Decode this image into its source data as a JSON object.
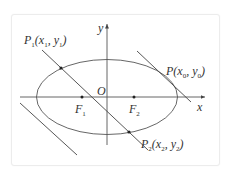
{
  "figure": {
    "type": "ellipse-with-chord-and-tangent",
    "colors": {
      "stroke": "#555555",
      "text": "#333333",
      "background": "#ffffff",
      "border": "#ececec"
    },
    "axes": {
      "x_label": "x",
      "y_label": "y",
      "origin_label": "O"
    },
    "foci": [
      {
        "name": "F",
        "sub": "1"
      },
      {
        "name": "F",
        "sub": "2"
      }
    ],
    "points": {
      "P": {
        "name": "P",
        "coords": "(x",
        "xsub": "0",
        "mid": ",  y",
        "ysub": "0",
        "close": ")"
      },
      "P1": {
        "name": "P",
        "namesub": "1",
        "coords": "(x",
        "xsub": "1",
        "mid": ",  y",
        "ysub": "1",
        "close": ")"
      },
      "P2": {
        "name": "P",
        "namesub": "2",
        "coords": "(x",
        "xsub": "2",
        "mid": ",  y",
        "ysub": "2",
        "close": ")"
      }
    }
  }
}
